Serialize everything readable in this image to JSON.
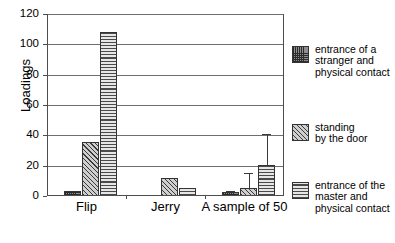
{
  "chart_data": {
    "type": "bar",
    "title": "",
    "xlabel": "",
    "ylabel": "Loadings",
    "ylim": [
      0,
      120
    ],
    "yticks": [
      0,
      20,
      40,
      60,
      80,
      100,
      120
    ],
    "ytick_labels": [
      "0",
      "20",
      "40",
      "60",
      "80",
      "100",
      "120"
    ],
    "grid": true,
    "legend_position": "right",
    "categories": [
      "Flip",
      "Jerry",
      "A sample of 50"
    ],
    "series": [
      {
        "name": "entrance of a stranger and physical contact",
        "legend_label_lines": [
          "entrance of a",
          "stranger and",
          "physical contact"
        ],
        "pattern": "fine-crosshatch-grid",
        "values": [
          3.5,
          0,
          2.5
        ],
        "errors_upper": [
          null,
          null,
          3.5
        ]
      },
      {
        "name": "standing by the door",
        "legend_label_lines": [
          "standing",
          "by the door"
        ],
        "pattern": "diagonal-hatch",
        "values": [
          35.5,
          12,
          5.5
        ],
        "errors_upper": [
          null,
          null,
          15
        ]
      },
      {
        "name": "entrance of the master and physical contact",
        "legend_label_lines": [
          "entrance of the",
          "master and",
          "physical contact"
        ],
        "pattern": "horizontal-lines",
        "values": [
          108,
          5.5,
          20.5
        ],
        "errors_upper": [
          null,
          null,
          41
        ]
      }
    ]
  },
  "axes": {
    "y_title": "Loadings"
  }
}
